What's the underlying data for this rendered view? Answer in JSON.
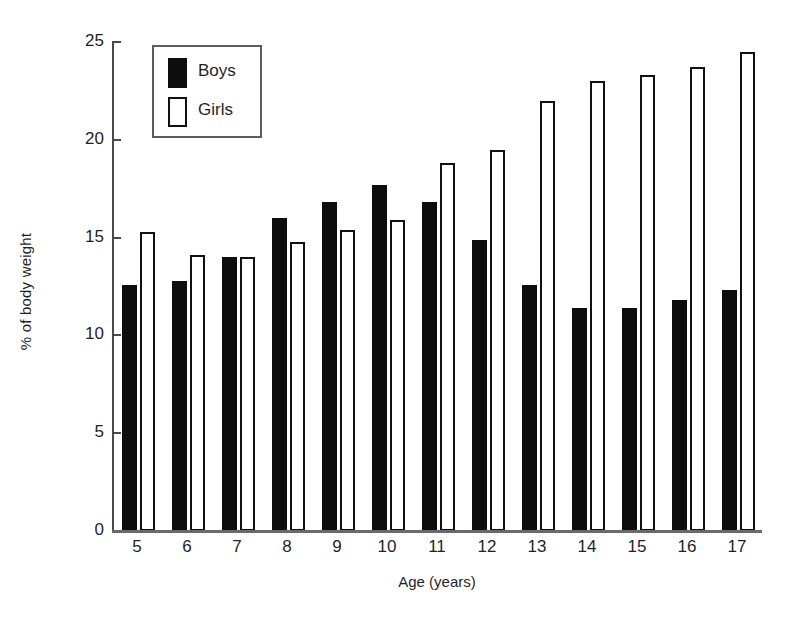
{
  "chart_data": {
    "type": "bar",
    "title": "",
    "xlabel": "Age (years)",
    "ylabel": "% of body weight",
    "categories": [
      "5",
      "6",
      "7",
      "8",
      "9",
      "10",
      "11",
      "12",
      "13",
      "14",
      "15",
      "16",
      "17"
    ],
    "series": [
      {
        "name": "Boys",
        "color": "#0d0d0d",
        "fill": "solid",
        "values": [
          12.6,
          12.8,
          14.0,
          16.0,
          16.8,
          17.7,
          16.8,
          14.9,
          12.6,
          11.4,
          11.4,
          11.8,
          12.3
        ]
      },
      {
        "name": "Girls",
        "color": "#ffffff",
        "fill": "outline",
        "values": [
          15.3,
          14.1,
          14.0,
          14.8,
          15.4,
          15.9,
          18.8,
          19.5,
          22.0,
          23.0,
          23.3,
          23.7,
          24.5
        ]
      }
    ],
    "ylim": [
      0,
      25
    ],
    "yticks": [
      0,
      5,
      10,
      15,
      20,
      25
    ],
    "ytick_labels": [
      "0",
      "5",
      "10",
      "15",
      "20",
      "25"
    ],
    "grid": false,
    "legend_position": "top-left",
    "legend": [
      "Boys",
      "Girls"
    ]
  },
  "axes": {
    "y_title": "% of body weight",
    "x_title": "Age (years)"
  },
  "legend": {
    "entries": [
      {
        "label": "Boys"
      },
      {
        "label": "Girls"
      }
    ]
  }
}
